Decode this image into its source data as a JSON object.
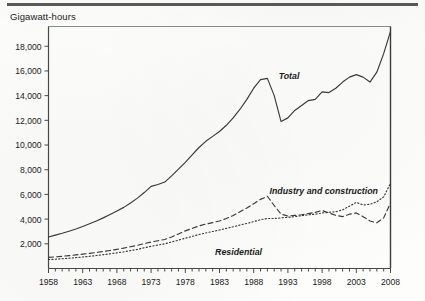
{
  "figure": {
    "axis_title": "Gigawatt-hours",
    "rule_color": "#5a5a58",
    "line_color": "#3a3a3a",
    "axis_color": "#4a4a4a",
    "text_color": "#1b1b1b"
  },
  "annotations": {
    "total_label": "Total",
    "industry_label": "Industry and construction",
    "residential_label": "Residential"
  },
  "chart_data": {
    "type": "line",
    "title": "",
    "subtitle": "",
    "xlabel": "",
    "ylabel": "Gigawatt-hours",
    "xlim": [
      1958,
      2008
    ],
    "ylim": [
      0,
      19600
    ],
    "grid": false,
    "legend": "inline-annotations",
    "ytick_labels": [
      "2,000",
      "4,000",
      "6,000",
      "8,000",
      "10,000",
      "12,000",
      "14,000",
      "16,000",
      "18,000"
    ],
    "yticks": [
      2000,
      4000,
      6000,
      8000,
      10000,
      12000,
      14000,
      16000,
      18000
    ],
    "xtick_labels": [
      "1958",
      "1963",
      "1968",
      "1973",
      "1978",
      "1983",
      "1988",
      "1993",
      "1998",
      "2003",
      "2008"
    ],
    "xticks_major": [
      1958,
      1963,
      1968,
      1973,
      1978,
      1983,
      1988,
      1993,
      1998,
      2003,
      2008
    ],
    "xticks_minor_every": 1,
    "x": [
      1958,
      1959,
      1960,
      1961,
      1962,
      1963,
      1964,
      1965,
      1966,
      1967,
      1968,
      1969,
      1970,
      1971,
      1972,
      1973,
      1974,
      1975,
      1976,
      1977,
      1978,
      1979,
      1980,
      1981,
      1982,
      1983,
      1984,
      1985,
      1986,
      1987,
      1988,
      1989,
      1990,
      1991,
      1992,
      1993,
      1994,
      1995,
      1996,
      1997,
      1998,
      1999,
      2000,
      2001,
      2002,
      2003,
      2004,
      2005,
      2006,
      2007,
      2008
    ],
    "series": [
      {
        "name": "Total",
        "style": "solid",
        "values": [
          2550,
          2700,
          2850,
          3020,
          3200,
          3400,
          3620,
          3850,
          4100,
          4380,
          4650,
          4950,
          5300,
          5700,
          6150,
          6650,
          6800,
          7000,
          7500,
          8050,
          8600,
          9200,
          9800,
          10300,
          10700,
          11100,
          11600,
          12200,
          12900,
          13700,
          14600,
          15300,
          15400,
          14000,
          11900,
          12200,
          12800,
          13200,
          13600,
          13700,
          14300,
          14250,
          14600,
          15100,
          15500,
          15700,
          15500,
          15100,
          15900,
          17400,
          19200
        ]
      },
      {
        "name": "Industry and construction",
        "style": "dashed",
        "values": [
          900,
          940,
          990,
          1040,
          1100,
          1160,
          1230,
          1300,
          1380,
          1460,
          1550,
          1650,
          1760,
          1880,
          2010,
          2150,
          2250,
          2350,
          2550,
          2800,
          3050,
          3250,
          3450,
          3600,
          3720,
          3850,
          4050,
          4300,
          4600,
          4900,
          5250,
          5600,
          5850,
          5100,
          4400,
          4250,
          4300,
          4350,
          4450,
          4550,
          4700,
          4500,
          4300,
          4200,
          4400,
          4500,
          4200,
          3850,
          3700,
          4100,
          5300
        ]
      },
      {
        "name": "Residential",
        "style": "dotted",
        "values": [
          720,
          750,
          790,
          830,
          880,
          930,
          990,
          1050,
          1120,
          1190,
          1270,
          1350,
          1450,
          1550,
          1680,
          1800,
          1900,
          2000,
          2150,
          2300,
          2450,
          2600,
          2750,
          2880,
          3000,
          3120,
          3250,
          3380,
          3520,
          3650,
          3800,
          3950,
          4050,
          4050,
          4100,
          4150,
          4200,
          4280,
          4350,
          4400,
          4500,
          4550,
          4600,
          4750,
          5050,
          5350,
          5150,
          5200,
          5400,
          5800,
          6900
        ]
      }
    ]
  }
}
